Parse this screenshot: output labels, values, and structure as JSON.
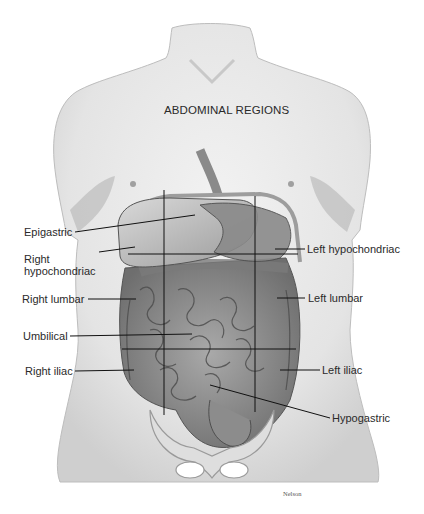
{
  "figure": {
    "title": "ABDOMINAL REGIONS",
    "signature": "Nelson",
    "grid": {
      "vertical_lines_x": [
        164,
        255
      ],
      "horizontal_lines_y": [
        254,
        349
      ]
    },
    "labels": [
      {
        "id": "epigastric",
        "text": "Epigastric",
        "side": "left"
      },
      {
        "id": "right-hypochondriac",
        "text": "Right\nhypochondriac",
        "line1": "Right",
        "line2": "hypochondriac",
        "side": "left"
      },
      {
        "id": "right-lumbar",
        "text": "Right lumbar",
        "side": "left"
      },
      {
        "id": "umbilical",
        "text": "Umbilical",
        "side": "left"
      },
      {
        "id": "right-iliac",
        "text": "Right iliac",
        "side": "left"
      },
      {
        "id": "left-hypochondriac",
        "text": "Left hypochondriac",
        "side": "right"
      },
      {
        "id": "left-lumbar",
        "text": "Left lumbar",
        "side": "right"
      },
      {
        "id": "left-iliac",
        "text": "Left iliac",
        "side": "right"
      },
      {
        "id": "hypogastric",
        "text": "Hypogastric",
        "side": "right"
      }
    ]
  }
}
